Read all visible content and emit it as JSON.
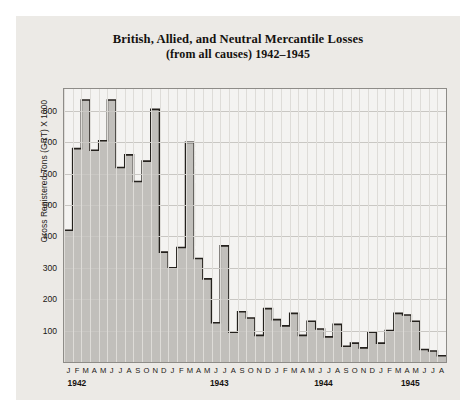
{
  "chart_data": {
    "type": "area",
    "title": "British, Allied, and Neutral Mercantile Losses",
    "subtitle": "(from all causes) 1942–1945",
    "title_line1": "British, Allied, and Neutral Mercantile Losses",
    "title_line2": "(from all causes) 1942–1945",
    "xlabel": "",
    "ylabel": "Gross Registered Tons (GRT) X 1000",
    "ylim": [
      0,
      870
    ],
    "yticks": [
      100,
      200,
      300,
      400,
      500,
      600,
      700,
      800
    ],
    "ytick_labels": [
      "100",
      "200",
      "300",
      "400",
      "500",
      "600",
      "700",
      "800"
    ],
    "grid": true,
    "legend": "none",
    "step_style": "post",
    "fill_color": "#b9b7b3",
    "line_color": "#24211d",
    "plot_bg": "#f4f3f1",
    "card_bg": "#eceae6",
    "page_bg": "#ffffff",
    "month_labels": [
      "J",
      "F",
      "M",
      "A",
      "M",
      "J",
      "J",
      "A",
      "S",
      "O",
      "N",
      "D"
    ],
    "year_labels": [
      "1942",
      "1943",
      "1944",
      "1945"
    ],
    "x_tick_labels": [
      "J",
      "F",
      "M",
      "A",
      "M",
      "J",
      "J",
      "A",
      "S",
      "O",
      "N",
      "D",
      "J",
      "F",
      "M",
      "A",
      "M",
      "J",
      "J",
      "A",
      "S",
      "O",
      "N",
      "D",
      "J",
      "F",
      "M",
      "A",
      "M",
      "J",
      "J",
      "A",
      "S",
      "O",
      "N",
      "D",
      "J",
      "F",
      "M",
      "A",
      "M",
      "J",
      "J",
      "A"
    ],
    "categories": [
      "Jan 1942",
      "Feb 1942",
      "Mar 1942",
      "Apr 1942",
      "May 1942",
      "Jun 1942",
      "Jul 1942",
      "Aug 1942",
      "Sep 1942",
      "Oct 1942",
      "Nov 1942",
      "Dec 1942",
      "Jan 1943",
      "Feb 1943",
      "Mar 1943",
      "Apr 1943",
      "May 1943",
      "Jun 1943",
      "Jul 1943",
      "Aug 1943",
      "Sep 1943",
      "Oct 1943",
      "Nov 1943",
      "Dec 1943",
      "Jan 1944",
      "Feb 1944",
      "Mar 1944",
      "Apr 1944",
      "May 1944",
      "Jun 1944",
      "Jul 1944",
      "Aug 1944",
      "Sep 1944",
      "Oct 1944",
      "Nov 1944",
      "Dec 1944",
      "Jan 1945",
      "Feb 1945",
      "Mar 1945",
      "Apr 1945",
      "May 1945",
      "Jun 1945",
      "Jul 1945",
      "Aug 1945"
    ],
    "values": [
      420,
      680,
      835,
      675,
      705,
      835,
      620,
      660,
      575,
      640,
      805,
      350,
      300,
      365,
      700,
      330,
      265,
      125,
      370,
      95,
      160,
      140,
      85,
      170,
      135,
      115,
      155,
      85,
      130,
      105,
      80,
      120,
      50,
      60,
      45,
      95,
      60,
      100,
      155,
      150,
      130,
      40,
      35,
      20
    ],
    "series": [
      {
        "name": "Mercantile losses (GRT x 1000)",
        "values": [
          420,
          680,
          835,
          675,
          705,
          835,
          620,
          660,
          575,
          640,
          805,
          350,
          300,
          365,
          700,
          330,
          265,
          125,
          370,
          95,
          160,
          140,
          85,
          170,
          135,
          115,
          155,
          85,
          130,
          105,
          80,
          120,
          50,
          60,
          45,
          95,
          60,
          100,
          155,
          150,
          130,
          40,
          35,
          20
        ]
      }
    ]
  }
}
